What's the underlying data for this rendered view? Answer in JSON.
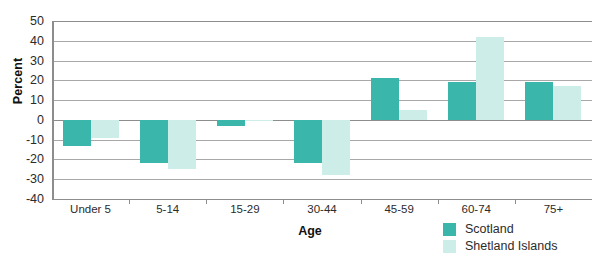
{
  "chart_data": {
    "type": "bar",
    "title": "",
    "xlabel": "Age",
    "ylabel": "Percent",
    "categories": [
      "Under 5",
      "5-14",
      "15-29",
      "30-44",
      "45-59",
      "60-74",
      "75+"
    ],
    "series": [
      {
        "name": "Scotland",
        "color": "#3ab6ab",
        "values": [
          -13,
          -22,
          -3,
          -22,
          21,
          19,
          19
        ]
      },
      {
        "name": "Shetland Islands",
        "color": "#cdeee8",
        "values": [
          -9,
          -25,
          0,
          -28,
          5,
          42,
          17
        ]
      }
    ],
    "ylim": [
      -40,
      50
    ],
    "yticks": [
      50,
      40,
      30,
      20,
      10,
      0,
      -10,
      -20,
      -30,
      -40
    ],
    "ytick_labels": [
      "50",
      "40",
      "30",
      "20",
      "10",
      "0",
      "-10",
      "-20",
      "-30",
      "-40"
    ],
    "grid": true,
    "legend_position": "bottom-right"
  },
  "axes": {
    "y_title": "Percent",
    "x_title": "Age"
  },
  "legend": {
    "items": [
      {
        "label": "Scotland",
        "color": "#3ab6ab"
      },
      {
        "label": "Shetland Islands",
        "color": "#cdeee8"
      }
    ]
  },
  "colors": {
    "scotland": "#3ab6ab",
    "shetland_islands": "#cdeee8",
    "gridline": "#a8a8a8",
    "axis": "#8d8d8d",
    "background": "#ffffff",
    "text": "#2b2b2b"
  }
}
